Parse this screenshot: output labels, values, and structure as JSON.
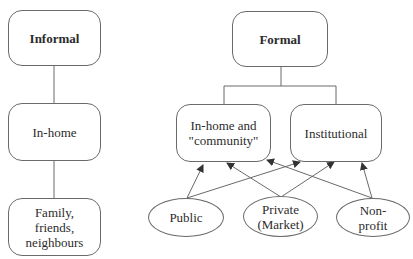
{
  "diagram": {
    "informal": {
      "title": "Informal",
      "level2": "In-home",
      "level3": "Family,\nfriends,\nneighbours"
    },
    "formal": {
      "title": "Formal",
      "children": [
        {
          "label": "In-home and\n\"community\""
        },
        {
          "label": "Institutional"
        }
      ],
      "providers": [
        {
          "label": "Public"
        },
        {
          "label": "Private\n(Market)"
        },
        {
          "label": "Non-\nprofit"
        }
      ]
    },
    "edges": [
      {
        "from": "Informal",
        "to": "In-home",
        "type": "line"
      },
      {
        "from": "In-home",
        "to": "Family, friends, neighbours",
        "type": "line"
      },
      {
        "from": "Formal",
        "to": "In-home and \"community\"",
        "type": "line"
      },
      {
        "from": "Formal",
        "to": "Institutional",
        "type": "line"
      },
      {
        "from": "Public",
        "to": "In-home and \"community\"",
        "type": "arrow"
      },
      {
        "from": "Public",
        "to": "Institutional",
        "type": "arrow"
      },
      {
        "from": "Private (Market)",
        "to": "In-home and \"community\"",
        "type": "arrow"
      },
      {
        "from": "Private (Market)",
        "to": "Institutional",
        "type": "arrow"
      },
      {
        "from": "Non-profit",
        "to": "In-home and \"community\"",
        "type": "arrow"
      },
      {
        "from": "Non-profit",
        "to": "Institutional",
        "type": "arrow"
      }
    ],
    "colors": {
      "stroke": "#6a6a6a",
      "text": "#2c2c2c",
      "background": "#ffffff"
    }
  }
}
